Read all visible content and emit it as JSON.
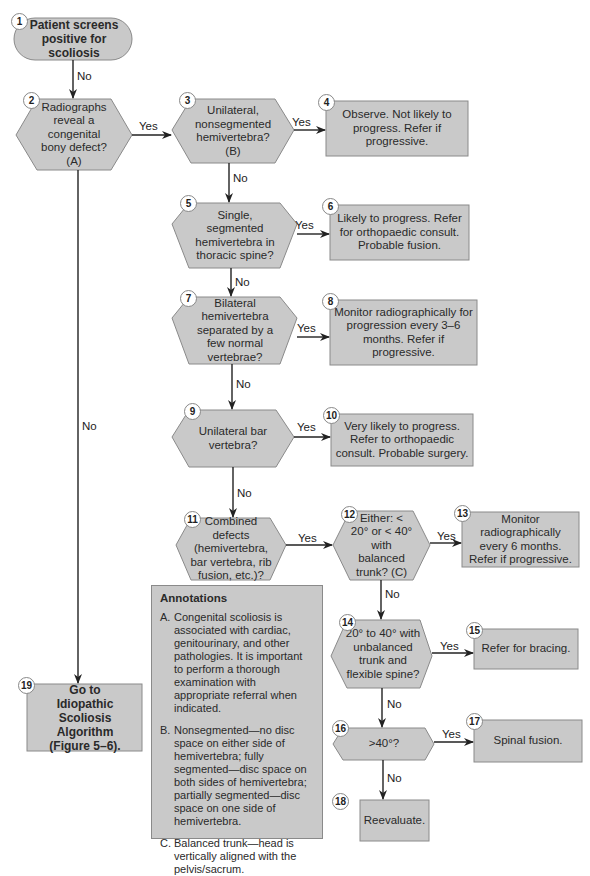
{
  "flowchart": {
    "nodes": [
      {
        "id": 1,
        "shape": "rounded",
        "text": "Patient screens positive for scoliosis"
      },
      {
        "id": 2,
        "shape": "hexagon",
        "text": "Radiographs reveal a congenital bony defect? (A)"
      },
      {
        "id": 3,
        "shape": "hexagon",
        "text": "Unilateral, nonsegmented hemivertebra? (B)"
      },
      {
        "id": 4,
        "shape": "box",
        "text": "Observe. Not likely to progress. Refer if progressive."
      },
      {
        "id": 5,
        "shape": "hexagon",
        "text": "Single, segmented hemivertebra in thoracic spine?"
      },
      {
        "id": 6,
        "shape": "box",
        "text": "Likely to progress. Refer for orthopaedic consult. Probable fusion."
      },
      {
        "id": 7,
        "shape": "hexagon",
        "text": "Bilateral hemivertebra separated by a few normal vertebrae?"
      },
      {
        "id": 8,
        "shape": "box",
        "text": "Monitor radiographically for progression every 3–6 months. Refer if progressive."
      },
      {
        "id": 9,
        "shape": "hexagon",
        "text": "Unilateral bar vertebra?"
      },
      {
        "id": 10,
        "shape": "box",
        "text": "Very likely to progress. Refer to orthopaedic consult. Probable surgery."
      },
      {
        "id": 11,
        "shape": "hexagon",
        "text": "Combined defects (hemivertebra, bar vertebra, rib fusion, etc.)?"
      },
      {
        "id": 12,
        "shape": "hexagon",
        "text": "Either: < 20° or < 40° with balanced trunk? (C)"
      },
      {
        "id": 13,
        "shape": "box",
        "text": "Monitor radiographically every 6 months. Refer if progressive."
      },
      {
        "id": 14,
        "shape": "hexagon",
        "text": "20° to 40° with unbalanced trunk and flexible spine?"
      },
      {
        "id": 15,
        "shape": "box",
        "text": "Refer for bracing."
      },
      {
        "id": 16,
        "shape": "hexagon",
        "text": ">40°?"
      },
      {
        "id": 17,
        "shape": "box",
        "text": "Spinal fusion."
      },
      {
        "id": 18,
        "shape": "box",
        "text": "Reevaluate."
      },
      {
        "id": 19,
        "shape": "box",
        "text": "Go to Idiopathic Scoliosis Algorithm (Figure 5–6)."
      }
    ],
    "edges": [
      {
        "from": 1,
        "to": 2,
        "label": "No"
      },
      {
        "from": 2,
        "to": 3,
        "label": "Yes"
      },
      {
        "from": 2,
        "to": 19,
        "label": "No"
      },
      {
        "from": 3,
        "to": 4,
        "label": "Yes"
      },
      {
        "from": 3,
        "to": 5,
        "label": "No"
      },
      {
        "from": 5,
        "to": 6,
        "label": "Yes"
      },
      {
        "from": 5,
        "to": 7,
        "label": "No"
      },
      {
        "from": 7,
        "to": 8,
        "label": "Yes"
      },
      {
        "from": 7,
        "to": 9,
        "label": "No"
      },
      {
        "from": 9,
        "to": 10,
        "label": "Yes"
      },
      {
        "from": 9,
        "to": 11,
        "label": "No"
      },
      {
        "from": 11,
        "to": 12,
        "label": "Yes"
      },
      {
        "from": 12,
        "to": 13,
        "label": "Yes"
      },
      {
        "from": 12,
        "to": 14,
        "label": "No"
      },
      {
        "from": 14,
        "to": 15,
        "label": "Yes"
      },
      {
        "from": 14,
        "to": 16,
        "label": "No"
      },
      {
        "from": 16,
        "to": 17,
        "label": "Yes"
      },
      {
        "from": 16,
        "to": 18,
        "label": "No"
      }
    ]
  },
  "labels": {
    "yes": "Yes",
    "no": "No"
  },
  "annotations": {
    "title": "Annotations",
    "items": [
      {
        "key": "A.",
        "text": "Congenital scoliosis is associated with cardiac, genitourinary, and other pathologies. It is important to perform a thorough examination with appropriate referral when indicated."
      },
      {
        "key": "B.",
        "text": "Nonsegmented—no disc space on either side of hemivertebra; fully segmented—disc space on both sides of hemivertebra; partially segmented—disc space on one side of hemivertebra."
      },
      {
        "key": "C.",
        "text": "Balanced trunk—head is vertically aligned with the pelvis/sacrum."
      }
    ]
  },
  "colors": {
    "shape_fill": "#c9c9c9",
    "shape_border": "#8a8a8a",
    "line": "#222222",
    "background": "#ffffff"
  }
}
